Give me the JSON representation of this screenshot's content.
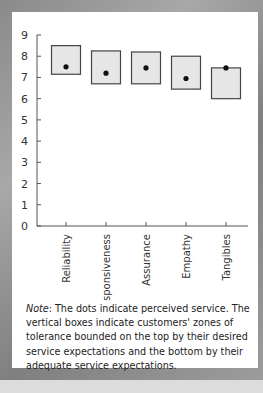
{
  "chart_data": {
    "type": "box-range",
    "title": "",
    "xlabel": "",
    "ylabel": "",
    "ylim": [
      0,
      9
    ],
    "yticks": [
      "0",
      "1",
      "2",
      "3",
      "4",
      "5",
      "6",
      "7",
      "8",
      "9"
    ],
    "categories": [
      "Reliability",
      "Responsiveness",
      "Assurance",
      "Empathy",
      "Tangibles"
    ],
    "series": [
      {
        "name": "Desired service (box top)",
        "values": [
          8.5,
          8.25,
          8.2,
          8.0,
          7.45
        ]
      },
      {
        "name": "Adequate service (box bottom)",
        "values": [
          7.15,
          6.7,
          6.7,
          6.45,
          6.0
        ]
      },
      {
        "name": "Perceived service (dot)",
        "values": [
          7.5,
          7.2,
          7.45,
          6.95,
          7.45
        ]
      }
    ],
    "grid": false,
    "legend": "none"
  },
  "note": {
    "label": "Note",
    "text": ": The dots indicate perceived service. The vertical boxes indicate customers' zones of tolerance bounded on the top by their desired service expectations and the bottom by their adequate service expectations."
  },
  "colors": {
    "box_fill": "#e6e6e6",
    "box_stroke": "#444444",
    "dot": "#111111",
    "axis": "#555555",
    "frame": "#8f8f8f"
  }
}
